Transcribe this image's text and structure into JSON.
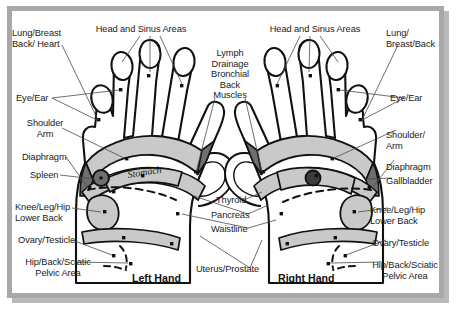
{
  "chart": {
    "title_present": false,
    "frame_color": "#a8a8a8",
    "background": "#ffffff",
    "ink": "#1a1a1a",
    "fill_light": "#c9c9c9",
    "fill_dark": "#6e6e6e"
  },
  "hands": {
    "left": {
      "caption": "Left Hand"
    },
    "right": {
      "caption": "Right Hand"
    }
  },
  "organ_labels": {
    "stomach": "Stomach",
    "liver": "Liver"
  },
  "labels": {
    "left_column": [
      {
        "id": "lung-breast-back-heart",
        "text": "Lung/Breast\nBack/ Heart"
      },
      {
        "id": "eye-ear",
        "text": "Eye/Ear"
      },
      {
        "id": "shoulder-arm",
        "text": "Shoulder\nArm"
      },
      {
        "id": "diaphragm",
        "text": "Diaphragm"
      },
      {
        "id": "spleen",
        "text": "Spleen"
      },
      {
        "id": "knee-leg-hip-lower-back",
        "text": "Knee/Leg/Hip\nLower Back"
      },
      {
        "id": "ovary-testicle",
        "text": "Ovary/Testicle"
      },
      {
        "id": "hip-back-sciatic-pelvic-area",
        "text": "Hip/Back/Sciatic\nPelvic Area"
      }
    ],
    "top_left": {
      "id": "head-and-sinus-areas-left",
      "text": "Head and Sinus Areas"
    },
    "top_right": {
      "id": "head-and-sinus-areas-right",
      "text": "Head and Sinus Areas"
    },
    "center_top": {
      "id": "lymph-drainage-bronchial-back-muscles",
      "text": "Lymph\nDrainage\nBronchial\nBack\nMuscles"
    },
    "center_bottom": [
      {
        "id": "thyroid",
        "text": "Thyroid"
      },
      {
        "id": "pancreas",
        "text": "Pancreas"
      },
      {
        "id": "waistline",
        "text": "Waistline"
      },
      {
        "id": "uterus-prostate",
        "text": "Uterus/Prostate"
      }
    ],
    "right_column": [
      {
        "id": "lung-breast-back",
        "text": "Lung/\nBreast/Back"
      },
      {
        "id": "eye-ear",
        "text": "Eye/Ear"
      },
      {
        "id": "shoulder-arm",
        "text": "Shoulder/\nArm"
      },
      {
        "id": "diaphragm",
        "text": "Diaphragm"
      },
      {
        "id": "gallbladder",
        "text": "Gallbladder"
      },
      {
        "id": "knee-leg-hip-lower-back",
        "text": "Knee/Leg/Hip\nLower Back"
      },
      {
        "id": "ovary-testicle",
        "text": "Ovary/Testicle"
      },
      {
        "id": "hip-back-sciatic-pelvic-area",
        "text": "Hip/Back/Sciatic\nPelvic Area"
      }
    ]
  }
}
